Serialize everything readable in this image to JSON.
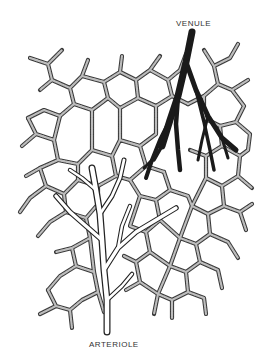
{
  "diagram": {
    "type": "anatomical-illustration",
    "labels": {
      "venule": "VENULE",
      "arteriole": "ARTERIOLE"
    },
    "colors": {
      "background": "#ffffff",
      "venule_fill": "#1a1a1a",
      "capillary_outline": "#3a3a3a",
      "capillary_texture": "#bdbdbd",
      "arteriole_outline": "#222222",
      "label_text": "#333333"
    },
    "structures": [
      {
        "name": "venule",
        "position": "top-right",
        "style": "solid dark branching vessel"
      },
      {
        "name": "arteriole",
        "position": "bottom-center",
        "style": "outlined white branching vessel"
      },
      {
        "name": "capillary network",
        "position": "full field",
        "style": "textured mesh of interconnecting vessels"
      }
    ]
  }
}
